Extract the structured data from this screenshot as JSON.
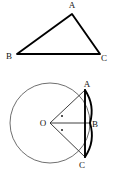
{
  "figure": {
    "background_color": "#ffffff",
    "ink_color": "#111111",
    "width": 117,
    "height": 181
  },
  "triangle": {
    "name": "triangle-ABC",
    "vertices": [
      {
        "id": "A",
        "label": "A",
        "x": 72,
        "y": 14,
        "label_x": 72,
        "label_y": 8
      },
      {
        "id": "B",
        "label": "B",
        "x": 17,
        "y": 54,
        "label_x": 9,
        "label_y": 59
      },
      {
        "id": "C",
        "label": "C",
        "x": 100,
        "y": 54,
        "label_x": 104,
        "label_y": 61
      }
    ],
    "edges": [
      {
        "from": "A",
        "to": "B"
      },
      {
        "from": "B",
        "to": "C"
      },
      {
        "from": "C",
        "to": "A"
      }
    ],
    "path": "M 72 14 L 17 54 L 100 54 Z",
    "stroke_color": "#1a1a1a",
    "stroke_width": 1.6
  },
  "circle_figure": {
    "name": "circle-with-chords",
    "circle": {
      "center_label": "O",
      "center_x": 50,
      "center_y": 123,
      "radius": 40,
      "stroke_color": "#4a4a4a",
      "stroke_width": 0.9
    },
    "points": [
      {
        "id": "O",
        "label": "O",
        "x": 50,
        "y": 123,
        "label_x": 43,
        "label_y": 126
      },
      {
        "id": "A",
        "label": "A",
        "x": 85,
        "y": 90,
        "label_x": 87,
        "label_y": 87
      },
      {
        "id": "B",
        "label": "B",
        "x": 90,
        "y": 123,
        "label_x": 95,
        "label_y": 127
      },
      {
        "id": "C",
        "label": "C",
        "x": 85,
        "y": 157,
        "label_x": 82,
        "label_y": 168
      }
    ],
    "radii": [
      {
        "from": "O",
        "to": "A",
        "path": "M 50 123 L 85 90"
      },
      {
        "from": "O",
        "to": "B",
        "path": "M 50 123 L 90 123"
      },
      {
        "from": "O",
        "to": "C",
        "path": "M 50 123 L 85 157"
      }
    ],
    "chord": {
      "from": "A",
      "to": "C",
      "path": "M 85 90 L 85 157",
      "stroke_color": "#000000",
      "stroke_width": 1.9
    },
    "highlighted_arcs": [
      {
        "id": "arc-AB",
        "from": "A",
        "to": "B",
        "path": "M 85 90 A 40 40 0 0 1 90 123"
      },
      {
        "id": "arc-BC",
        "from": "B",
        "to": "C",
        "path": "M 90 123 A 40 40 0 0 1 85 157"
      }
    ],
    "angle_markers": [
      {
        "id": "angle-marker-upper",
        "x": 62,
        "y": 116,
        "r": 1.0
      },
      {
        "id": "angle-marker-lower",
        "x": 62,
        "y": 130,
        "r": 1.0
      }
    ]
  }
}
